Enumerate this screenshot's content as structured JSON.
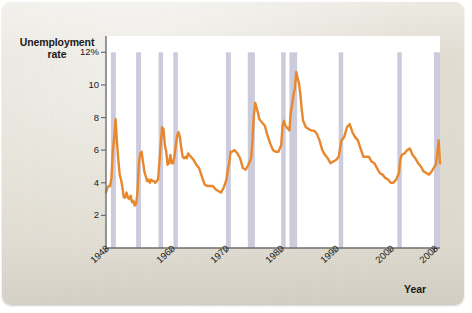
{
  "figure": {
    "card_background": "#e5e1d6",
    "plot_background": "#ffffff",
    "line_color": "#E8872B",
    "band_color": "#c3c2d6",
    "axis_color": "#6e6e6e"
  },
  "chart_data": {
    "type": "line",
    "title": "",
    "xlabel": "Year",
    "ylabel": "Unemployment rate",
    "ylabel_line1": "Unemployment",
    "ylabel_line2": "rate",
    "grid": false,
    "legend": "none",
    "xlim": [
      1948,
      2009
    ],
    "ylim": [
      0,
      13
    ],
    "ytick_labels": [
      "12%",
      "10",
      "8",
      "6",
      "4",
      "2"
    ],
    "ytick_values": [
      12,
      10,
      8,
      6,
      4,
      2
    ],
    "xtick_labels": [
      "1948",
      "1960",
      "1970",
      "1980",
      "1990",
      "2000",
      "2008"
    ],
    "xtick_values": [
      1948,
      1960,
      1970,
      1980,
      1990,
      2000,
      2008
    ],
    "series": [
      {
        "name": "Unemployment rate",
        "color": "#E8872B",
        "x": [
          1948.0,
          1948.25,
          1948.5,
          1948.75,
          1949.0,
          1949.25,
          1949.5,
          1949.75,
          1950.0,
          1950.25,
          1950.5,
          1950.75,
          1951.0,
          1951.25,
          1951.5,
          1951.75,
          1952.0,
          1952.25,
          1952.5,
          1952.75,
          1953.0,
          1953.25,
          1953.5,
          1953.75,
          1954.0,
          1954.25,
          1954.5,
          1954.75,
          1955.0,
          1955.25,
          1955.5,
          1955.75,
          1956.0,
          1956.25,
          1956.5,
          1956.75,
          1957.0,
          1957.25,
          1957.5,
          1957.75,
          1958.0,
          1958.25,
          1958.5,
          1958.75,
          1959.0,
          1959.25,
          1959.5,
          1959.75,
          1960.0,
          1960.25,
          1960.5,
          1960.75,
          1961.0,
          1961.25,
          1961.5,
          1961.75,
          1962.0,
          1962.25,
          1962.5,
          1962.75,
          1963.0,
          1963.25,
          1963.5,
          1963.75,
          1964.0,
          1964.5,
          1965.0,
          1965.5,
          1966.0,
          1966.5,
          1967.0,
          1967.5,
          1968.0,
          1968.5,
          1969.0,
          1969.5,
          1970.0,
          1970.25,
          1970.5,
          1970.75,
          1971.0,
          1971.5,
          1972.0,
          1972.5,
          1973.0,
          1973.5,
          1974.0,
          1974.5,
          1974.75,
          1975.0,
          1975.25,
          1975.5,
          1975.75,
          1976.0,
          1976.5,
          1977.0,
          1977.5,
          1978.0,
          1978.5,
          1979.0,
          1979.5,
          1980.0,
          1980.25,
          1980.5,
          1980.75,
          1981.0,
          1981.5,
          1981.75,
          1982.0,
          1982.25,
          1982.5,
          1982.75,
          1983.0,
          1983.25,
          1983.5,
          1983.75,
          1984.0,
          1984.5,
          1985.0,
          1985.5,
          1986.0,
          1986.5,
          1987.0,
          1987.5,
          1988.0,
          1988.5,
          1989.0,
          1989.5,
          1990.0,
          1990.5,
          1990.75,
          1991.0,
          1991.5,
          1992.0,
          1992.5,
          1993.0,
          1993.5,
          1994.0,
          1994.5,
          1995.0,
          1995.5,
          1996.0,
          1996.5,
          1997.0,
          1997.5,
          1998.0,
          1998.5,
          1999.0,
          1999.5,
          2000.0,
          2000.5,
          2001.0,
          2001.25,
          2001.5,
          2001.75,
          2002.0,
          2002.5,
          2003.0,
          2003.5,
          2004.0,
          2004.5,
          2005.0,
          2005.5,
          2006.0,
          2006.5,
          2007.0,
          2007.5,
          2008.0,
          2008.25,
          2008.5,
          2008.75,
          2009.0
        ],
        "y": [
          3.4,
          3.7,
          3.8,
          3.8,
          4.3,
          6.0,
          6.8,
          7.9,
          6.5,
          5.4,
          4.5,
          4.2,
          3.7,
          3.1,
          3.1,
          3.4,
          3.1,
          3.0,
          3.2,
          2.8,
          2.9,
          2.6,
          2.7,
          3.4,
          5.2,
          5.8,
          5.9,
          5.3,
          4.7,
          4.4,
          4.1,
          4.2,
          4.0,
          4.2,
          4.1,
          4.1,
          4.0,
          4.1,
          4.2,
          5.2,
          6.4,
          7.4,
          7.3,
          6.3,
          5.9,
          5.1,
          5.2,
          5.7,
          5.2,
          5.2,
          5.6,
          6.3,
          6.9,
          7.1,
          6.8,
          6.1,
          5.6,
          5.5,
          5.6,
          5.5,
          5.8,
          5.7,
          5.6,
          5.5,
          5.4,
          5.1,
          4.9,
          4.4,
          3.9,
          3.8,
          3.8,
          3.8,
          3.6,
          3.5,
          3.4,
          3.7,
          4.2,
          4.8,
          5.2,
          5.9,
          5.9,
          6.0,
          5.8,
          5.5,
          4.9,
          4.8,
          5.1,
          5.5,
          6.6,
          8.1,
          8.9,
          8.6,
          8.3,
          7.9,
          7.7,
          7.5,
          6.9,
          6.4,
          6.0,
          5.9,
          5.9,
          6.3,
          7.5,
          7.8,
          7.5,
          7.4,
          7.2,
          8.3,
          8.8,
          9.4,
          9.8,
          10.8,
          10.4,
          10.1,
          9.4,
          8.5,
          7.8,
          7.4,
          7.3,
          7.2,
          7.2,
          7.0,
          6.6,
          6.0,
          5.7,
          5.5,
          5.2,
          5.3,
          5.4,
          5.6,
          6.1,
          6.6,
          6.8,
          7.4,
          7.6,
          7.1,
          6.8,
          6.6,
          6.1,
          5.6,
          5.6,
          5.6,
          5.3,
          5.2,
          4.9,
          4.6,
          4.5,
          4.3,
          4.2,
          4.0,
          4.0,
          4.2,
          4.4,
          4.6,
          5.4,
          5.7,
          5.8,
          6.0,
          6.1,
          5.7,
          5.5,
          5.2,
          5.0,
          4.7,
          4.6,
          4.5,
          4.7,
          5.0,
          5.1,
          5.8,
          6.6,
          5.2
        ]
      }
    ],
    "recession_bands": [
      {
        "start": 1948.9,
        "end": 1949.8
      },
      {
        "start": 1953.5,
        "end": 1954.4
      },
      {
        "start": 1957.6,
        "end": 1958.3
      },
      {
        "start": 1960.3,
        "end": 1961.1
      },
      {
        "start": 1969.9,
        "end": 1970.8
      },
      {
        "start": 1973.9,
        "end": 1975.2
      },
      {
        "start": 1980.0,
        "end": 1980.5
      },
      {
        "start": 1981.5,
        "end": 1982.9
      },
      {
        "start": 1990.5,
        "end": 1991.2
      },
      {
        "start": 2001.2,
        "end": 2001.9
      },
      {
        "start": 2007.9,
        "end": 2009.0
      }
    ]
  }
}
